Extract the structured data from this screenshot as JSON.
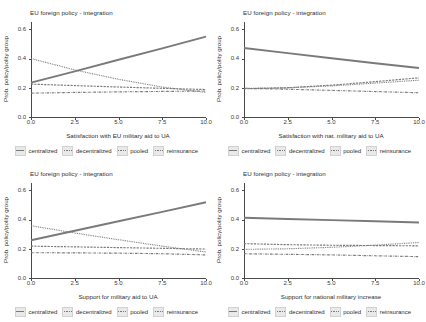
{
  "figure": {
    "panel_count": 4,
    "shared_title": "EU foreign policy - integration",
    "shared_ylabel": "Prob. policy/polity group",
    "y_ticks": [
      "0.0",
      "0.2",
      "0.4",
      "0.6"
    ],
    "x_ticks": [
      "0.0",
      "2.5",
      "5.0",
      "7.5",
      "10.0"
    ],
    "legend": [
      {
        "label": "centralized",
        "style": "solid",
        "color": "#6e6e6e"
      },
      {
        "label": "decentralized",
        "style": "dashed",
        "color": "#6e6e6e"
      },
      {
        "label": "pooled",
        "style": "dotted",
        "color": "#6e6e6e"
      },
      {
        "label": "reinsurance",
        "style": "dashdotted",
        "color": "#6e6e6e"
      }
    ]
  },
  "panels": [
    {
      "id": "panel-top-left",
      "title": "EU foreign policy - integration",
      "xlabel": "Satisfaction with EU military aid to UA",
      "ylabel": "Prob. policy/polity group"
    },
    {
      "id": "panel-top-right",
      "title": "EU foreign policy - integration",
      "xlabel": "Satisfaction with nat. military aid to UA",
      "ylabel": "Prob. policy/polity group"
    },
    {
      "id": "panel-bottom-left",
      "title": "EU foreign policy - integration",
      "xlabel": "Support for military aid to UA",
      "ylabel": "Prob. policy/polity group"
    },
    {
      "id": "panel-bottom-right",
      "title": "EU foreign policy - integration",
      "xlabel": "Support for national military increase",
      "ylabel": "Prob. policy/polity group"
    }
  ],
  "chart_data": [
    {
      "type": "line",
      "panel": "panel-top-left",
      "title": "EU foreign policy - integration",
      "xlabel": "Satisfaction with EU military aid to UA",
      "ylabel": "Prob. policy/polity group",
      "xlim": [
        0,
        10
      ],
      "ylim": [
        0,
        0.65
      ],
      "xticks": [
        0,
        2.5,
        5,
        7.5,
        10
      ],
      "yticks": [
        0.0,
        0.2,
        0.4,
        0.6
      ],
      "grid": false,
      "legend_position": "bottom",
      "x": [
        0,
        2.5,
        5,
        7.5,
        10
      ],
      "series": [
        {
          "name": "centralized",
          "style": "solid",
          "values": [
            0.235,
            0.312,
            0.392,
            0.47,
            0.55
          ]
        },
        {
          "name": "decentralized",
          "style": "dashed",
          "values": [
            0.225,
            0.215,
            0.205,
            0.196,
            0.188
          ]
        },
        {
          "name": "pooled",
          "style": "dotted",
          "values": [
            0.4,
            0.322,
            0.258,
            0.205,
            0.168
          ]
        },
        {
          "name": "reinsurance",
          "style": "dashdotted",
          "values": [
            0.163,
            0.168,
            0.172,
            0.175,
            0.178
          ]
        }
      ]
    },
    {
      "type": "line",
      "panel": "panel-top-right",
      "title": "EU foreign policy - integration",
      "xlabel": "Satisfaction with nat. military aid to UA",
      "ylabel": "Prob. policy/polity group",
      "xlim": [
        0,
        10
      ],
      "ylim": [
        0,
        0.65
      ],
      "xticks": [
        0,
        2.5,
        5,
        7.5,
        10
      ],
      "yticks": [
        0.0,
        0.2,
        0.4,
        0.6
      ],
      "grid": false,
      "legend_position": "bottom",
      "x": [
        0,
        2.5,
        5,
        7.5,
        10
      ],
      "series": [
        {
          "name": "centralized",
          "style": "solid",
          "values": [
            0.472,
            0.437,
            0.402,
            0.368,
            0.335
          ]
        },
        {
          "name": "decentralized",
          "style": "dashed",
          "values": [
            0.193,
            0.2,
            0.218,
            0.242,
            0.268
          ]
        },
        {
          "name": "pooled",
          "style": "dotted",
          "values": [
            0.196,
            0.2,
            0.213,
            0.232,
            0.252
          ]
        },
        {
          "name": "reinsurance",
          "style": "dashdotted",
          "values": [
            0.196,
            0.19,
            0.182,
            0.174,
            0.166
          ]
        }
      ]
    },
    {
      "type": "line",
      "panel": "panel-bottom-left",
      "title": "EU foreign policy - integration",
      "xlabel": "Support for military aid to UA",
      "ylabel": "Prob. policy/polity group",
      "xlim": [
        0,
        10
      ],
      "ylim": [
        0,
        0.65
      ],
      "xticks": [
        0,
        2.5,
        5,
        7.5,
        10
      ],
      "yticks": [
        0.0,
        0.2,
        0.4,
        0.6
      ],
      "grid": false,
      "legend_position": "bottom",
      "x": [
        0,
        2.5,
        5,
        7.5,
        10
      ],
      "series": [
        {
          "name": "centralized",
          "style": "solid",
          "values": [
            0.258,
            0.323,
            0.388,
            0.452,
            0.518
          ]
        },
        {
          "name": "decentralized",
          "style": "dashed",
          "values": [
            0.218,
            0.213,
            0.208,
            0.203,
            0.198
          ]
        },
        {
          "name": "pooled",
          "style": "dotted",
          "values": [
            0.358,
            0.308,
            0.262,
            0.218,
            0.178
          ]
        },
        {
          "name": "reinsurance",
          "style": "dashdotted",
          "values": [
            0.173,
            0.172,
            0.17,
            0.166,
            0.158
          ]
        }
      ]
    },
    {
      "type": "line",
      "panel": "panel-bottom-right",
      "title": "EU foreign policy - integration",
      "xlabel": "Support for national military increase",
      "ylabel": "Prob. policy/polity group",
      "xlim": [
        0,
        10
      ],
      "ylim": [
        0,
        0.65
      ],
      "xticks": [
        0,
        2.5,
        5,
        7.5,
        10
      ],
      "yticks": [
        0.0,
        0.2,
        0.4,
        0.6
      ],
      "grid": false,
      "legend_position": "bottom",
      "x": [
        0,
        2.5,
        5,
        7.5,
        10
      ],
      "series": [
        {
          "name": "centralized",
          "style": "solid",
          "values": [
            0.412,
            0.404,
            0.396,
            0.388,
            0.38
          ]
        },
        {
          "name": "decentralized",
          "style": "dashed",
          "values": [
            0.235,
            0.228,
            0.224,
            0.222,
            0.22
          ]
        },
        {
          "name": "pooled",
          "style": "dotted",
          "values": [
            0.196,
            0.2,
            0.21,
            0.225,
            0.243
          ]
        },
        {
          "name": "reinsurance",
          "style": "dashdotted",
          "values": [
            0.166,
            0.162,
            0.158,
            0.152,
            0.146
          ]
        }
      ]
    }
  ]
}
